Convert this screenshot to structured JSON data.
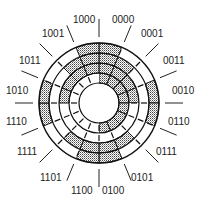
{
  "diagram": {
    "type": "gray-code-encoder-disk",
    "center": [
      99,
      103
    ],
    "ring_radii": [
      20,
      30,
      40,
      50,
      60
    ],
    "shade_color": "#b8b8b8",
    "line_color": "#111111",
    "shading_rule": "shaded where bit = 0; innermost ring = MSB, outermost ring = LSB",
    "sectors": [
      "0000",
      "0001",
      "0011",
      "0010",
      "0110",
      "0111",
      "0101",
      "0100",
      "1100",
      "1101",
      "1111",
      "1110",
      "1010",
      "1011",
      "1001",
      "1000"
    ],
    "labels": [
      {
        "text": "0000",
        "x": 112,
        "y": 23
      },
      {
        "text": "0001",
        "x": 141,
        "y": 37
      },
      {
        "text": "0011",
        "x": 163,
        "y": 64
      },
      {
        "text": "0010",
        "x": 172,
        "y": 94
      },
      {
        "text": "0110",
        "x": 168,
        "y": 125
      },
      {
        "text": "0111",
        "x": 156,
        "y": 155
      },
      {
        "text": "0101",
        "x": 131,
        "y": 181
      },
      {
        "text": "0100",
        "x": 102,
        "y": 194
      },
      {
        "text": "1100",
        "x": 71,
        "y": 194
      },
      {
        "text": "1101",
        "x": 40,
        "y": 181
      },
      {
        "text": "1111",
        "x": 17,
        "y": 155
      },
      {
        "text": "1110",
        "x": 6,
        "y": 125
      },
      {
        "text": "1010",
        "x": 6,
        "y": 94
      },
      {
        "text": "1011",
        "x": 19,
        "y": 64
      },
      {
        "text": "1001",
        "x": 42,
        "y": 37
      },
      {
        "text": "1000",
        "x": 73,
        "y": 23
      }
    ]
  }
}
